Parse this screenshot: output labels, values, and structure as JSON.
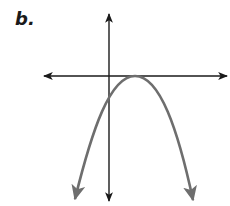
{
  "label": "b.",
  "colors": {
    "axes": "#1a1a1a",
    "curve": "#6e6e6e",
    "background": "#ffffff"
  },
  "diagram": {
    "type": "graph-of-function",
    "axes": {
      "x_axis": {
        "from": [
          42,
          76
        ],
        "to": [
          229,
          76
        ],
        "arrows": "both"
      },
      "y_axis": {
        "from": [
          109,
          12
        ],
        "to": [
          109,
          203
        ],
        "arrows": "both"
      }
    },
    "curve": {
      "shape": "parabola",
      "opens": "down",
      "vertex": [
        135,
        76
      ],
      "y_intercept_px": [
        109,
        97
      ],
      "left_end": [
        73,
        202
      ],
      "right_end": [
        195,
        203
      ],
      "arrows": "both ends"
    }
  }
}
